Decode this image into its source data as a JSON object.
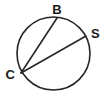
{
  "figure": {
    "background_color": "#ffffff",
    "stroke_color": "#262626",
    "label_color": "#1a1a1a",
    "stroke_width": 1.6,
    "width": 107,
    "height": 94
  },
  "circle": {
    "name": "main-circle",
    "center_x": 53.5,
    "center_y": 53.5,
    "radius": 36.5,
    "fill": "none"
  },
  "points": [
    {
      "id": "B",
      "label": "B",
      "x": 57,
      "y": 18,
      "label_x": 57,
      "label_y": 14,
      "label_anchor": "middle",
      "label_position": "above"
    },
    {
      "id": "S",
      "label": "S",
      "x": 86,
      "y": 36,
      "label_x": 91,
      "label_y": 38,
      "label_anchor": "start",
      "label_position": "right"
    },
    {
      "id": "C",
      "label": "C",
      "x": 21,
      "y": 73,
      "label_x": 15,
      "label_y": 79,
      "label_anchor": "end",
      "label_position": "left"
    }
  ],
  "chords": [
    {
      "id": "CB",
      "name": "chord-c-b",
      "from": "C",
      "from_x": 21,
      "from_y": 73,
      "to": "B",
      "to_x": 57,
      "to_y": 18
    },
    {
      "id": "CS",
      "name": "chord-c-s",
      "from": "C",
      "from_x": 21,
      "from_y": 73,
      "to": "S",
      "to_x": 86,
      "to_y": 36
    }
  ],
  "label_font_size": 13
}
